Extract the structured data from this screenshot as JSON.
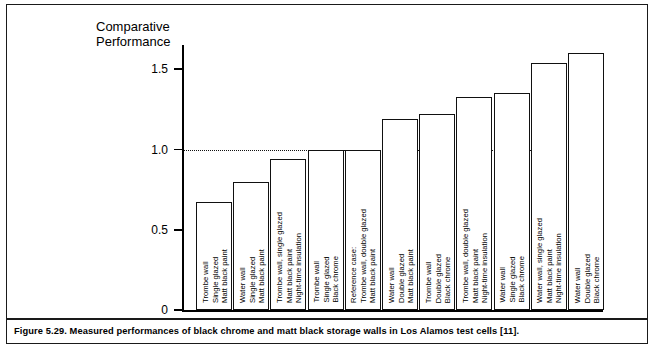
{
  "figure": {
    "caption": "Figure 5.29.  Measured performances of black chrome and matt black storage walls in Los Alamos test cells [11]."
  },
  "chart_data": {
    "type": "bar",
    "title": "",
    "ylabel": "Comparative\nPerformance",
    "xlabel": "",
    "ylim": [
      0,
      1.75
    ],
    "yticks": [
      "0",
      "0.5",
      "1.0",
      "1.5"
    ],
    "ytick_values": [
      0,
      0.5,
      1.0,
      1.5
    ],
    "grid": "dotted horizontal reference line at 1.0",
    "gridlines": [
      1.0
    ],
    "legend": "none",
    "categories": [
      "Trombe wall\nSingle glazed\nMatt black paint",
      "Water wall\nSingle glazed\nMatt black paint",
      "Trombe wall, single glazed\nMatt black paint\nNight-time insulation",
      "Trombe wall\nSingle glazed\nBlack chrome",
      "Reference case:\nTrombe wall, double glazed\nMatt black paint",
      "Water wall\nDouble glazed\nMatt black paint",
      "Trombe wall\nDouble glazed\nBlack chrome",
      "Trombe wall, double glazed\nMatt black paint\nNight-time insulation",
      "Water wall\nSingle glazed\nBlack chrome",
      "Water wall, single glazed\nMatt black paint\nNight-time insulation",
      "Water wall\nDouble glazed\nBlack chrome"
    ],
    "values": [
      0.67,
      0.8,
      0.94,
      1.0,
      1.0,
      1.19,
      1.22,
      1.33,
      1.35,
      1.54,
      1.6
    ]
  }
}
